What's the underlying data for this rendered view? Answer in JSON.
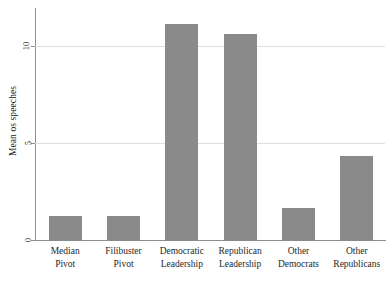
{
  "chart_data": {
    "type": "bar",
    "title": "",
    "xlabel": "",
    "ylabel": "Mean os speeches",
    "categories": [
      "Median Pivot",
      "Filibuster Pivot",
      "Democratic Leadership",
      "Republican Leadership",
      "Other Democrats",
      "Other Republicans"
    ],
    "category_lines": [
      {
        "line1": "Median",
        "line2": "Pivot"
      },
      {
        "line1": "Filibuster",
        "line2": "Pivot"
      },
      {
        "line1": "Democratic",
        "line2": "Leadership"
      },
      {
        "line1": "Republican",
        "line2": "Leadership"
      },
      {
        "line1": "Other",
        "line2": "Democrats"
      },
      {
        "line1": "Other",
        "line2": "Republicans"
      }
    ],
    "values": [
      1.3,
      1.3,
      11.2,
      10.7,
      1.7,
      4.4
    ],
    "ylim": [
      0,
      12
    ],
    "yticks": [
      0,
      5,
      10
    ],
    "ytick_labels": [
      "0",
      "5",
      "10"
    ],
    "grid": true,
    "legend": "none",
    "bar_color": "#8a8a8a",
    "grid_color": "#dedede",
    "axis_color": "#8f8f8f"
  }
}
